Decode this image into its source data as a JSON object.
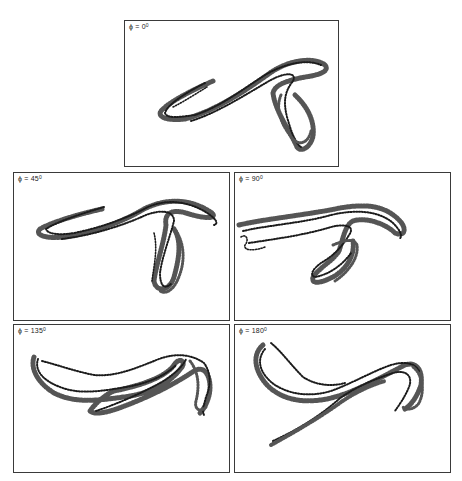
{
  "figure": {
    "panels": [
      {
        "id": "phi-0",
        "label_prefix": "ϕ = 0",
        "degree": "0",
        "position": "top-center"
      },
      {
        "id": "phi-45",
        "label_prefix": "ϕ = 45",
        "degree": "0",
        "position": "middle-left"
      },
      {
        "id": "phi-90",
        "label_prefix": "ϕ = 90",
        "degree": "0",
        "position": "middle-right"
      },
      {
        "id": "phi-135",
        "label_prefix": "ϕ = 135",
        "degree": "0",
        "position": "bottom-left"
      },
      {
        "id": "phi-180",
        "label_prefix": "ϕ = 180",
        "degree": "0",
        "position": "bottom-right"
      }
    ],
    "colors": {
      "ink": "#1c1c1c",
      "border": "#3a3a3a",
      "background": "#ffffff"
    }
  }
}
